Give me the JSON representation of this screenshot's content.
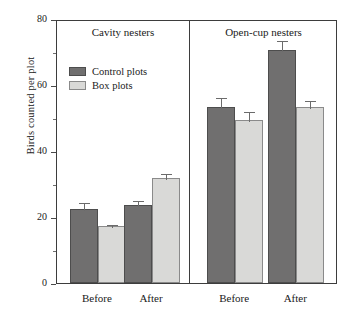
{
  "chart_data": {
    "type": "bar",
    "title": "",
    "xlabel": "",
    "ylabel": "Birds counted per plot",
    "ylim": [
      0,
      80
    ],
    "yticks": [
      0,
      20,
      40,
      60,
      80
    ],
    "yticks_minor": [
      10,
      30,
      50,
      70
    ],
    "grid": false,
    "legend_position": "upper-left-inside",
    "panels": [
      {
        "title": "Cavity nesters",
        "categories": [
          "Before",
          "After"
        ],
        "series": [
          {
            "name": "Control plots",
            "values": [
              22.5,
              23.6
            ],
            "errors": [
              2.2,
              2.0
            ]
          },
          {
            "name": "Box plots",
            "values": [
              17.3,
              31.8
            ],
            "errors": [
              0.9,
              1.8
            ]
          }
        ]
      },
      {
        "title": "Open-cup nesters",
        "categories": [
          "Before",
          "After"
        ],
        "series": [
          {
            "name": "Control plots",
            "values": [
              53.2,
              70.5
            ],
            "errors": [
              3.6,
              3.3
            ]
          },
          {
            "name": "Box plots",
            "values": [
              49.4,
              53.2
            ],
            "errors": [
              3.1,
              2.5
            ]
          }
        ]
      }
    ],
    "legend": [
      {
        "label": "Control plots",
        "color": "#706f6f"
      },
      {
        "label": "Box plots",
        "color": "#d9d9d7"
      }
    ]
  },
  "axis": {
    "y_title": "Birds counted per plot",
    "y_tick_labels": [
      "80",
      "60",
      "40",
      "20",
      "0"
    ]
  },
  "panels": {
    "left": {
      "title": "Cavity nesters",
      "group_before": "Before",
      "group_after": "After"
    },
    "right": {
      "title": "Open-cup nesters",
      "group_before": "Before",
      "group_after": "After"
    }
  },
  "legend": {
    "control_label": "Control plots",
    "box_label": "Box plots"
  },
  "colors": {
    "control": "#706f6f",
    "box": "#d9d9d7",
    "axis": "#3d3d3d"
  }
}
